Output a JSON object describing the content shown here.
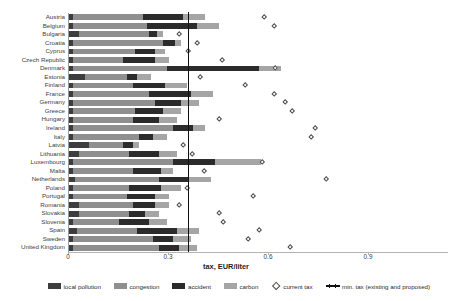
{
  "axis": {
    "x_title": "tax, EUR/liter",
    "x_ticks": [
      "0",
      "0.3",
      "0.6",
      "0.9"
    ],
    "x_tick_values": [
      0,
      0.3,
      0.6,
      0.9
    ],
    "x_min": 0,
    "x_max": 1.14
  },
  "legend": {
    "items": [
      {
        "label": "local pollution",
        "color": "#3d3d3d",
        "marker": "swatch"
      },
      {
        "label": "congestion",
        "color": "#8f8f8f",
        "marker": "swatch"
      },
      {
        "label": "accident",
        "color": "#2b2b2b",
        "marker": "swatch"
      },
      {
        "label": "carbon",
        "color": "#a5a5a5",
        "marker": "swatch"
      },
      {
        "label": "current tax",
        "color": "#4a4a4a",
        "marker": "diamond"
      },
      {
        "label": "min. tax (existing and proposed)",
        "color": "#111111",
        "marker": "step-line"
      }
    ]
  },
  "chart_data": {
    "type": "bar",
    "orientation": "horizontal",
    "stacked": true,
    "title": "",
    "xlabel": "tax, EUR/liter",
    "ylabel": "",
    "xlim": [
      0,
      1.14
    ],
    "grid": false,
    "legend_position": "bottom",
    "categories": [
      "Austria",
      "Belgium",
      "Bulgaria",
      "Croatia",
      "Cyprus",
      "Czech Republic",
      "Denmark",
      "Estonia",
      "Finland",
      "France",
      "Germany",
      "Greece",
      "Hungary",
      "Ireland",
      "Italy",
      "Latvia",
      "Lithuania",
      "Luxembourg",
      "Malta",
      "Netherlands",
      "Poland",
      "Portugal",
      "Romania",
      "Slovakia",
      "Slovenia",
      "Spain",
      "Sweden",
      "United Kingdom"
    ],
    "series": [
      {
        "name": "local pollution",
        "color": "#3d3d3d",
        "values": [
          0.012,
          0.012,
          0.03,
          0.012,
          0.012,
          0.012,
          0.012,
          0.048,
          0.012,
          0.012,
          0.012,
          0.012,
          0.012,
          0.012,
          0.012,
          0.06,
          0.03,
          0.012,
          0.012,
          0.018,
          0.012,
          0.012,
          0.03,
          0.03,
          0.012,
          0.024,
          0.012,
          0.012
        ]
      },
      {
        "name": "congestion",
        "color": "#8f8f8f",
        "values": [
          0.21,
          0.222,
          0.21,
          0.27,
          0.186,
          0.15,
          0.282,
          0.126,
          0.18,
          0.228,
          0.246,
          0.186,
          0.18,
          0.3,
          0.198,
          0.102,
          0.15,
          0.3,
          0.18,
          0.252,
          0.168,
          0.162,
          0.162,
          0.15,
          0.138,
          0.18,
          0.24,
          0.258
        ]
      },
      {
        "name": "accident",
        "color": "#2b2b2b",
        "values": [
          0.12,
          0.15,
          0.024,
          0.036,
          0.06,
          0.096,
          0.276,
          0.03,
          0.096,
          0.126,
          0.078,
          0.084,
          0.078,
          0.06,
          0.042,
          0.03,
          0.09,
          0.126,
          0.084,
          0.09,
          0.096,
          0.084,
          0.066,
          0.048,
          0.09,
          0.12,
          0.06,
          0.06
        ]
      },
      {
        "name": "carbon",
        "color": "#a5a5a5",
        "values": [
          0.066,
          0.066,
          0.018,
          0.018,
          0.03,
          0.042,
          0.066,
          0.042,
          0.066,
          0.066,
          0.054,
          0.054,
          0.054,
          0.036,
          0.042,
          0.018,
          0.054,
          0.138,
          0.036,
          0.066,
          0.06,
          0.042,
          0.042,
          0.042,
          0.054,
          0.066,
          0.054,
          0.054
        ]
      }
    ],
    "current_tax": {
      "name": "current tax",
      "values": [
        0.587,
        0.615,
        0.33,
        0.385,
        0.357,
        0.46,
        0.62,
        0.393,
        0.53,
        0.615,
        0.65,
        0.67,
        0.45,
        0.74,
        0.728,
        0.343,
        0.37,
        0.58,
        0.405,
        0.772,
        0.354,
        0.553,
        0.33,
        0.45,
        0.462,
        0.572,
        0.538,
        0.665
      ]
    },
    "min_tax": {
      "name": "min. tax (existing and proposed)",
      "value": 0.359,
      "description": "vertical stepped line at the EU minimum tax level"
    }
  }
}
